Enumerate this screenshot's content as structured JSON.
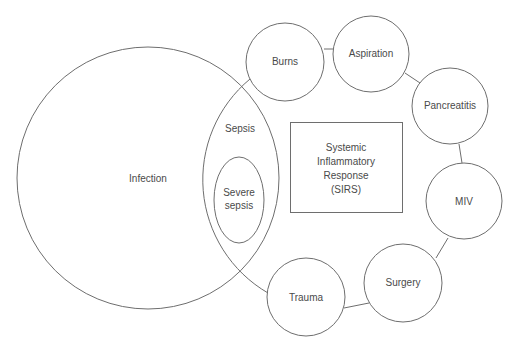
{
  "diagram": {
    "type": "venn-relationship",
    "colors": {
      "stroke": "#6e6e6e",
      "text": "#4a4a4a",
      "background": "#ffffff"
    },
    "infection": {
      "label": "Infection"
    },
    "sepsis": {
      "label": "Sepsis"
    },
    "severe_sepsis": {
      "line1": "Severe",
      "line2": "sepsis"
    },
    "sirs_box": {
      "line1": "Systemic",
      "line2": "Inflammatory",
      "line3": "Response",
      "line4": "(SIRS)"
    },
    "causes": [
      {
        "label": "Burns"
      },
      {
        "label": "Aspiration"
      },
      {
        "label": "Pancreatitis"
      },
      {
        "label": "MIV"
      },
      {
        "label": "Surgery"
      },
      {
        "label": "Trauma"
      }
    ]
  }
}
